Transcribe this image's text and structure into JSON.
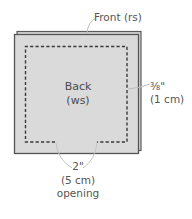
{
  "diagram": {
    "type": "sewing-pattern-illustration",
    "labels": {
      "front": "Front (rs)",
      "back_line1": "Back",
      "back_line2": "(ws)",
      "seam_allowance_line1": "⅜\"",
      "seam_allowance_line2": "(1 cm)",
      "opening_line1": "2\"",
      "opening_line2": "(5 cm)",
      "opening_line3": "opening"
    },
    "colors": {
      "fabric_fill": "#d9d9d9",
      "fabric_border": "#5a5a5a",
      "stitch_line": "#3a3a3a",
      "leader_line": "#bdbdbd",
      "text": "#555555",
      "background": "#ffffff"
    }
  }
}
